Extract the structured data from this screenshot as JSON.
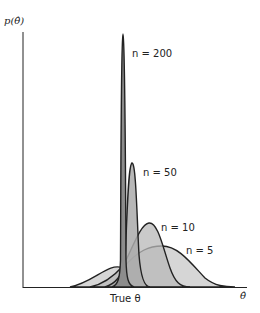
{
  "axes": {
    "y_label": "p(θ̂)",
    "x_label": "θ̂",
    "true_theta_label": "True θ"
  },
  "curves": [
    {
      "n_label": "n = 200",
      "n": 200
    },
    {
      "n_label": "n = 50",
      "n": 50
    },
    {
      "n_label": "n = 10",
      "n": 10
    },
    {
      "n_label": "n = 5",
      "n": 5
    }
  ],
  "colors": {
    "fill": "#b0b0b0",
    "stroke": "#222222",
    "background": "#ffffff"
  }
}
